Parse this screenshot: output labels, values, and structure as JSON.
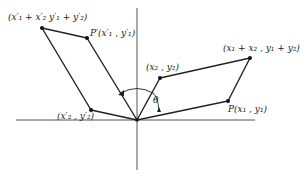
{
  "diagram": {
    "type": "vector-rotation",
    "origin": {
      "x": 137,
      "y": 120
    },
    "axes": {
      "horizontal": {
        "x1": 16,
        "x2": 255,
        "y": 120
      },
      "vertical": {
        "x": 137,
        "y1": 8,
        "y2": 170
      }
    },
    "points": {
      "p1": {
        "x": 228,
        "y": 101,
        "label": "P(x₁ , y₁)"
      },
      "p2": {
        "x": 160,
        "y": 78,
        "label": "(x₂ , y₂)"
      },
      "sum": {
        "x": 250,
        "y": 58,
        "label": "(x₁ + x₂ , y₁ + y₂)"
      },
      "p1r": {
        "x": 87,
        "y": 38,
        "label": "P′(x′₁ , y′₁)"
      },
      "p2r": {
        "x": 91,
        "y": 110,
        "label": "(x′₂ , y′₂)"
      },
      "sumr": {
        "x": 42,
        "y": 28,
        "label": "(x′₁ + x′₂ y′₁ + y′₂)"
      }
    },
    "angle": {
      "label": "θ"
    }
  }
}
